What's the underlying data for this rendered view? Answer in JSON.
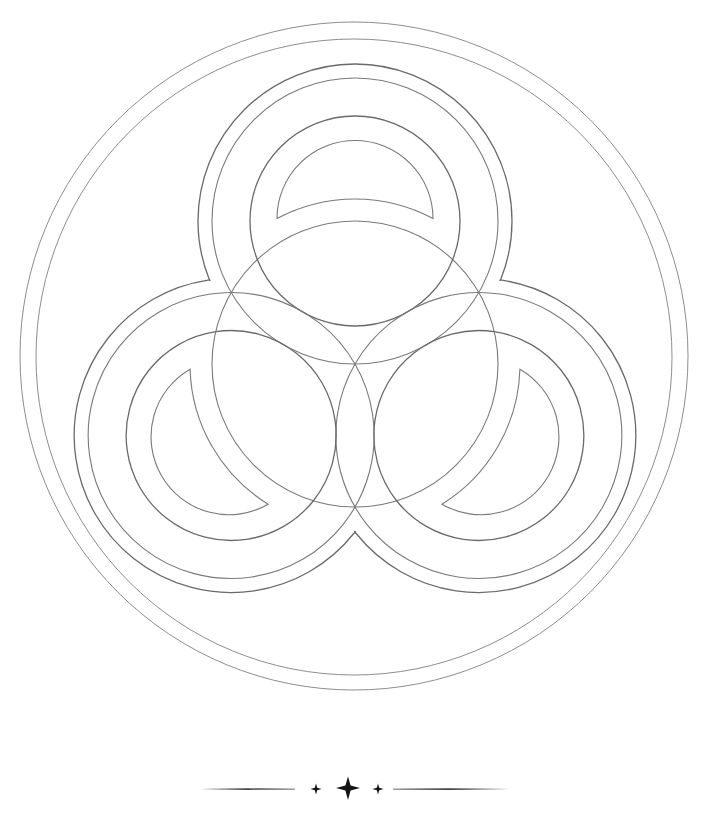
{
  "artwork": {
    "title": "Triple-ring geometric pencil drawing",
    "style": "graphite line drawing on white paper",
    "colors": {
      "paper": "#ffffff",
      "pencil_line": "#7a7a7a",
      "ornament_ink": "#141414"
    },
    "geometry": {
      "center": [
        355,
        364
      ],
      "outer_circle_radius": 334,
      "inner_border_radius": 318,
      "central_circle_radius": 143,
      "lobe_offset": 143,
      "lobe_ring_outer_radius": 157,
      "lobe_ring_inner_radius": 143,
      "lobe_circle_radius": 105,
      "crescent_outer_radius": 78,
      "crescent_inner_radius": 165,
      "lobe_count": 3
    },
    "lobes": [
      {
        "position": "top",
        "center": [
          355,
          221
        ]
      },
      {
        "position": "bottom-right",
        "center": [
          479,
          436
        ]
      },
      {
        "position": "bottom-left",
        "center": [
          231,
          436
        ]
      }
    ]
  },
  "divider": {
    "y": 789,
    "left_line": [
      200,
      295
    ],
    "right_line": [
      393,
      510
    ],
    "stars": [
      {
        "x": 316,
        "size": "small"
      },
      {
        "x": 348,
        "size": "large"
      },
      {
        "x": 378,
        "size": "small"
      }
    ]
  }
}
